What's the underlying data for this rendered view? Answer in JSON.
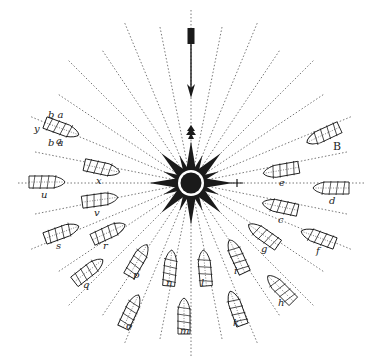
{
  "figure": {
    "title": "",
    "colors": {
      "ink": "#1a1a1a",
      "line": "#555555",
      "background": "#ffffff"
    },
    "center": {
      "x": 191,
      "y": 183
    },
    "north_arrow": {
      "x": 191,
      "y_top": 28,
      "y_bottom": 98
    },
    "rays_count": 32
  },
  "ships": [
    {
      "label": "a",
      "top": "b a",
      "bottom": "b a",
      "side": "y",
      "x": 60,
      "y": 128,
      "angle": 20
    },
    {
      "label": "x",
      "x": 100,
      "y": 168,
      "angle": 12
    },
    {
      "label": "u",
      "x": 45,
      "y": 182,
      "angle": 0
    },
    {
      "label": "v",
      "x": 98,
      "y": 200,
      "angle": -8
    },
    {
      "label": "s",
      "x": 60,
      "y": 233,
      "angle": -20
    },
    {
      "label": "r",
      "x": 107,
      "y": 233,
      "angle": -25
    },
    {
      "label": "q",
      "x": 87,
      "y": 272,
      "angle": -38
    },
    {
      "label": "p",
      "x": 137,
      "y": 262,
      "angle": -60
    },
    {
      "label": "o",
      "x": 130,
      "y": 313,
      "angle": -65
    },
    {
      "label": "n",
      "x": 170,
      "y": 270,
      "angle": -85
    },
    {
      "label": "m",
      "x": 184,
      "y": 318,
      "angle": -90
    },
    {
      "label": "l",
      "x": 205,
      "y": 270,
      "angle": -95
    },
    {
      "label": "i",
      "x": 238,
      "y": 258,
      "angle": -115
    },
    {
      "label": "k",
      "x": 237,
      "y": 310,
      "angle": -110
    },
    {
      "label": "h",
      "x": 282,
      "y": 290,
      "angle": -135
    },
    {
      "label": "g",
      "x": 265,
      "y": 236,
      "angle": -145
    },
    {
      "label": "f",
      "x": 320,
      "y": 238,
      "angle": -160
    },
    {
      "label": "c",
      "x": 282,
      "y": 207,
      "angle": -168
    },
    {
      "label": "d",
      "x": 333,
      "y": 188,
      "angle": 180
    },
    {
      "label": "e",
      "x": 283,
      "y": 170,
      "angle": 170
    },
    {
      "label": "B",
      "x": 325,
      "y": 134,
      "angle": 155
    }
  ]
}
